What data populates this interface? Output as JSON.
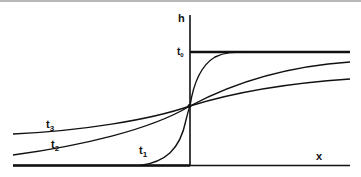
{
  "diagram": {
    "axes": {
      "y_label": "h",
      "x_label": "x"
    },
    "curves": [
      {
        "id": "t0",
        "label": "t",
        "subscript": "0",
        "shape": "step"
      },
      {
        "id": "t1",
        "label": "t",
        "subscript": "1",
        "shape": "steep sigmoid"
      },
      {
        "id": "t2",
        "label": "t",
        "subscript": "2",
        "shape": "moderate sigmoid"
      },
      {
        "id": "t3",
        "label": "t",
        "subscript": "3",
        "shape": "gentle sigmoid"
      }
    ],
    "colors": {
      "ink": "#111111",
      "background": "#ffffff",
      "border": "#b8b8b8"
    }
  }
}
